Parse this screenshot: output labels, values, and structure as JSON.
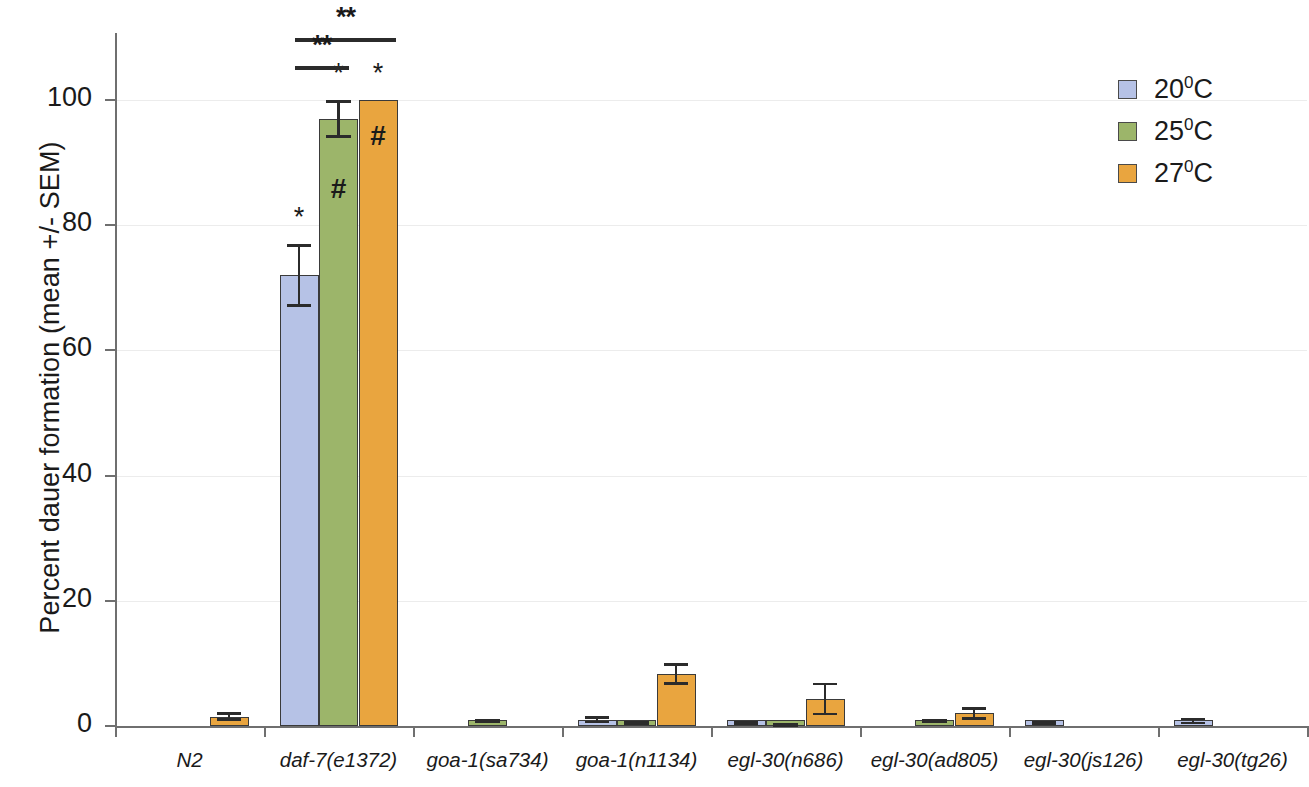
{
  "chart_data": {
    "type": "bar",
    "title": "",
    "xlabel": "",
    "ylabel": "Percent dauer formation (mean +/- SEM)",
    "ylim": [
      0,
      110
    ],
    "yticks": [
      0,
      20,
      40,
      60,
      80,
      100
    ],
    "grid": true,
    "legend_position": "top-right",
    "categories": [
      "N2",
      "daf-7(e1372)",
      "goa-1(sa734)",
      "goa-1(n1134)",
      "egl-30(n686)",
      "egl-30(ad805)",
      "egl-30(js126)",
      "egl-30(tg26)"
    ],
    "series": [
      {
        "name": "20°C",
        "color": "#b6c2e6",
        "values": [
          0,
          72,
          0,
          1.0,
          0.5,
          0,
          0.5,
          0.8
        ],
        "errors": [
          0,
          5,
          0,
          0.6,
          0.3,
          0,
          0.3,
          0.5
        ]
      },
      {
        "name": "25°C",
        "color": "#9cb56a",
        "values": [
          0,
          97,
          0.8,
          0.6,
          0.3,
          0.8,
          0,
          0
        ],
        "errors": [
          0,
          3,
          0.3,
          0.2,
          0.2,
          0.3,
          0,
          0
        ]
      },
      {
        "name": "27°C",
        "color": "#e9a53f",
        "values": [
          1.5,
          100,
          0,
          8.3,
          4.3,
          2.0,
          0,
          0
        ],
        "errors": [
          0.7,
          0,
          0,
          1.7,
          2.6,
          1.0,
          0,
          0
        ]
      }
    ],
    "annotations": [
      {
        "text": "*",
        "category": "daf-7(e1372)",
        "series": "20°C",
        "placement": "above-bar"
      },
      {
        "text": "*",
        "category": "daf-7(e1372)",
        "series": "25°C",
        "placement": "above-bar"
      },
      {
        "text": "#",
        "category": "daf-7(e1372)",
        "series": "25°C",
        "placement": "inside-bar"
      },
      {
        "text": "*",
        "category": "daf-7(e1372)",
        "series": "27°C",
        "placement": "above-bar"
      },
      {
        "text": "#",
        "category": "daf-7(e1372)",
        "series": "27°C",
        "placement": "inside-bar"
      }
    ],
    "significance_brackets": [
      {
        "label": "**",
        "from": "daf-7(e1372) 20°C",
        "to": "daf-7(e1372) 27°C"
      },
      {
        "label": "**",
        "from": "daf-7(e1372) 20°C",
        "to": "daf-7(e1372) 25°C"
      }
    ]
  },
  "axis": {
    "y_title": "Percent dauer formation (mean +/- SEM)",
    "y_labels": [
      "100",
      "80",
      "60",
      "40",
      "20",
      "0"
    ],
    "x_labels": [
      "N2",
      "daf-7(e1372)",
      "goa-1(sa734)",
      "goa-1(n1134)",
      "egl-30(n686)",
      "egl-30(ad805)",
      "egl-30(js126)",
      "egl-30(tg26)"
    ]
  },
  "legend": {
    "items": [
      {
        "value": "20",
        "unit": "0",
        "scale": "C"
      },
      {
        "value": "25",
        "unit": "0",
        "scale": "C"
      },
      {
        "value": "27",
        "unit": "0",
        "scale": "C"
      }
    ]
  },
  "marks": {
    "star": "*",
    "hash": "#",
    "double_star": "**"
  }
}
